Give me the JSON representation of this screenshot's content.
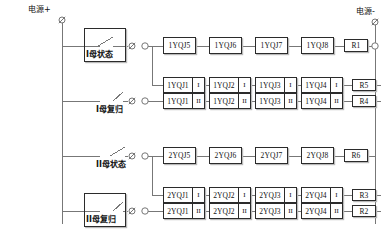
{
  "diagram": {
    "power_positive": "电源+",
    "power_negative": "电源-",
    "line_color": "#777777",
    "box_border_color": "#2b2b2b",
    "shadow_color": "#b9b9b9",
    "background": "#ffffff"
  },
  "inputs": [
    {
      "id": "bus1-status",
      "label": "I母状态",
      "boxed": true,
      "switch": "normally-open-angled"
    },
    {
      "id": "bus1-reset",
      "label": "I母复归",
      "boxed": false,
      "switch": "normally-open-angled"
    },
    {
      "id": "bus2-status",
      "label": "II母状态",
      "boxed": false,
      "switch": "normally-open-angled"
    },
    {
      "id": "bus2-reset",
      "label": "II母复归",
      "boxed": true,
      "switch": "normally-open-angled"
    }
  ],
  "rows": [
    {
      "id": "row-1",
      "kind": "single",
      "components": [
        "1YQJ5",
        "1YQJ6",
        "1YQJ7",
        "1YQJ8"
      ],
      "resistor": "R1"
    },
    {
      "id": "row-2",
      "kind": "paired",
      "roman": "I",
      "components": [
        "1YQJ1",
        "1YQJ2",
        "1YQJ3",
        "1YQJ4"
      ],
      "resistor": "R5"
    },
    {
      "id": "row-3",
      "kind": "paired",
      "roman": "II",
      "components": [
        "1YQJ1",
        "1YQJ2",
        "1YQJ3",
        "1YQJ4"
      ],
      "resistor": "R4"
    },
    {
      "id": "row-4",
      "kind": "single",
      "components": [
        "2YQJ5",
        "2YQJ6",
        "2YQJ7",
        "2YQJ8"
      ],
      "resistor": "R6"
    },
    {
      "id": "row-5",
      "kind": "paired",
      "roman": "I",
      "components": [
        "2YQJ1",
        "2YQJ2",
        "2YQJ3",
        "2YQJ4"
      ],
      "resistor": "R3"
    },
    {
      "id": "row-6",
      "kind": "paired",
      "roman": "II",
      "components": [
        "2YQJ1",
        "2YQJ2",
        "2YQJ3",
        "2YQJ4"
      ],
      "resistor": "R2"
    }
  ],
  "terminals": {
    "symbol_slashed": "slashed-circle-terminal",
    "symbol_open": "open-circle-terminal"
  }
}
